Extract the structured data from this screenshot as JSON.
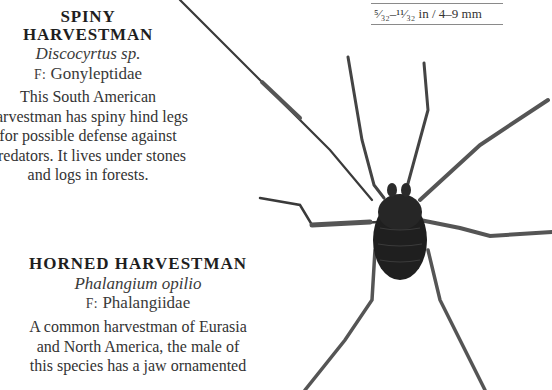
{
  "size_label": "⁵⁄₃₂–¹¹⁄₃₂ in / 4–9 mm",
  "entries": [
    {
      "title_line1": "SPINY",
      "title_line2": "HARVESTMAN",
      "latin": "Discocyrtus sp.",
      "family_prefix": "F:",
      "family": "Gonyleptidae",
      "description": [
        "This South American",
        "harvestman has spiny hind legs",
        "for possible defense against",
        "predators. It lives under stones",
        "and logs in forests."
      ]
    },
    {
      "title": "HORNED HARVESTMAN",
      "latin": "Phalangium opilio",
      "family_prefix": "F:",
      "family": "Phalangiidae",
      "description": [
        "A common harvestman of Eurasia",
        "and North America, the male of",
        "this species has a jaw ornamented"
      ]
    }
  ],
  "image": {
    "subject": "harvestman-specimen-photo",
    "colors": {
      "body": "#1f1f1f",
      "legs": "#4a4a4a",
      "background": "#ffffff"
    }
  }
}
